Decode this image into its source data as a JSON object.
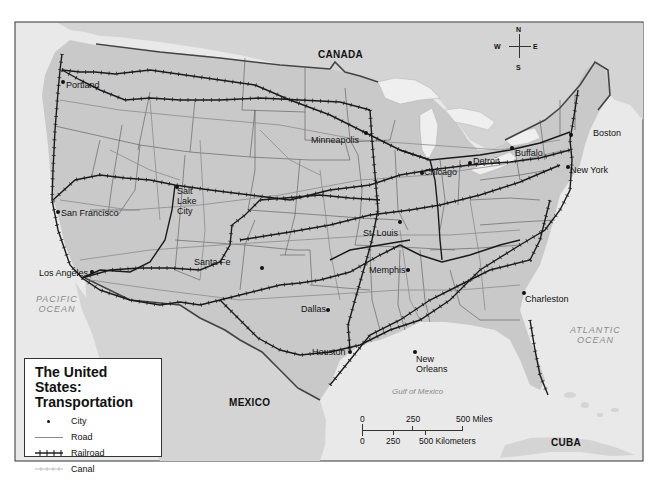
{
  "map": {
    "title_line1": "The United States:",
    "title_line2": "Transportation",
    "colors": {
      "land_us": "#c9c9c9",
      "land_foreign": "#d4d4d4",
      "water": "#e9e9e9",
      "lakes": "#efefef",
      "railroad": "#1a1a1a",
      "road": "#8c8c8c",
      "state_border": "#555555",
      "national_border": "#444444",
      "ocean_label": "#8a8a8a"
    }
  },
  "countries": {
    "canada": "CANADA",
    "mexico": "MEXICO",
    "cuba": "CUBA"
  },
  "water_bodies": {
    "pacific_line1": "PACIFIC",
    "pacific_line2": "OCEAN",
    "atlantic_line1": "ATLANTIC",
    "atlantic_line2": "OCEAN",
    "gulf": "Gulf of Mexico"
  },
  "cities": [
    {
      "name": "Portland"
    },
    {
      "name": "San Francisco"
    },
    {
      "name": "Los Angeles"
    },
    {
      "name": "Salt"
    },
    {
      "name": "Lake"
    },
    {
      "name": "City"
    },
    {
      "name": "Santa Fe"
    },
    {
      "name": "Minneapolis"
    },
    {
      "name": "Chicago"
    },
    {
      "name": "Detroit"
    },
    {
      "name": "Buffalo"
    },
    {
      "name": "Boston"
    },
    {
      "name": "New York"
    },
    {
      "name": "St. Louis"
    },
    {
      "name": "Memphis"
    },
    {
      "name": "Dallas"
    },
    {
      "name": "Houston"
    },
    {
      "name": "New"
    },
    {
      "name": "Orleans"
    },
    {
      "name": "Charleston"
    }
  ],
  "legend": {
    "items": [
      {
        "symbol": "dot",
        "label": "City"
      },
      {
        "symbol": "line",
        "label": "Road"
      },
      {
        "symbol": "hatched-line",
        "label": "Railroad"
      },
      {
        "symbol": "thin-hatched-line",
        "label": "Canal"
      }
    ]
  },
  "compass": {
    "n": "N",
    "s": "S",
    "e": "E",
    "w": "W"
  },
  "scale_bar": {
    "miles_ticks": [
      "0",
      "250",
      "500 Miles"
    ],
    "km_ticks": [
      "0",
      "250",
      "500 Kilometers"
    ]
  }
}
